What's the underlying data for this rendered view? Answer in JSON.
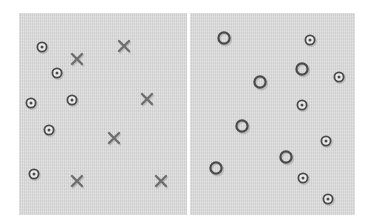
{
  "figure": {
    "panels": [
      {
        "id": "left",
        "targets": [
          [
            42,
            47
          ],
          [
            57,
            73
          ],
          [
            31,
            103
          ],
          [
            72,
            100
          ],
          [
            49,
            130
          ],
          [
            34,
            174
          ]
        ],
        "crosses": [
          [
            77,
            59
          ],
          [
            124,
            46
          ],
          [
            147,
            99
          ],
          [
            114,
            138
          ],
          [
            77,
            181
          ],
          [
            161,
            181
          ]
        ]
      },
      {
        "id": "right",
        "rings": [
          [
            224,
            38
          ],
          [
            302,
            69
          ],
          [
            260,
            82
          ],
          [
            242,
            126
          ],
          [
            216,
            168
          ],
          [
            286,
            157
          ]
        ],
        "targets": [
          [
            310,
            40
          ],
          [
            339,
            77
          ],
          [
            302,
            105
          ],
          [
            326,
            141
          ],
          [
            303,
            178
          ],
          [
            328,
            199
          ]
        ]
      }
    ],
    "colors": {
      "panel_bg": "#d9d9d9",
      "mark": "#4a4a4a",
      "cross": "#6e6e6e",
      "shadow": "#a8a8a8"
    }
  }
}
